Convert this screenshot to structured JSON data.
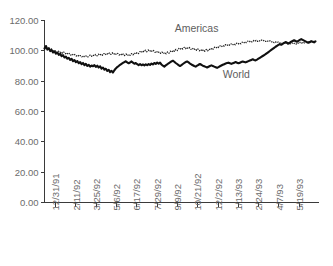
{
  "chart_data": {
    "type": "line",
    "title": "",
    "subtitle": "",
    "xlabel": "",
    "ylabel": "",
    "grid": false,
    "legend_position": "inline-annotation",
    "ylim": [
      0,
      120
    ],
    "ytick_labels": [
      "0.00",
      "20.00",
      "40.00",
      "60.00",
      "80.00",
      "100.00",
      "120.00"
    ],
    "ytick_values": [
      0,
      20,
      40,
      60,
      80,
      100,
      120
    ],
    "xtick_labels": [
      "12/31/91",
      "2/11/92",
      "3/25/92",
      "5/6/92",
      "6/17/92",
      "7/29/92",
      "9/9/92",
      "10/21/92",
      "12/2/92",
      "1/13/93",
      "2/24/93",
      "4/7/93",
      "5/19/93"
    ],
    "annotations": [
      {
        "text": "Americas",
        "x_frac": 0.555,
        "value": 112.5
      },
      {
        "text": "World",
        "x_frac": 0.7,
        "value": 82.0
      }
    ],
    "series": [
      {
        "name": "Americas",
        "style": "dotted",
        "color": "#1a1a1a",
        "values": [
          101.0,
          102.3,
          100.8,
          101.6,
          100.4,
          101.3,
          100.2,
          99.4,
          100.1,
          99.0,
          99.8,
          98.6,
          99.5,
          98.4,
          99.2,
          98.0,
          98.8,
          97.6,
          98.3,
          97.2,
          98.0,
          96.9,
          97.6,
          96.6,
          97.3,
          96.2,
          96.9,
          96.0,
          96.8,
          95.9,
          96.6,
          95.7,
          96.4,
          97.2,
          96.3,
          97.4,
          96.5,
          97.6,
          96.7,
          97.8,
          96.9,
          98.0,
          97.1,
          98.2,
          97.3,
          98.5,
          97.5,
          98.6,
          97.7,
          98.8,
          97.6,
          98.5,
          97.4,
          98.3,
          97.2,
          98.1,
          97.0,
          98.0,
          96.9,
          97.9,
          96.8,
          97.8,
          97.0,
          98.2,
          97.3,
          98.6,
          97.8,
          99.0,
          98.2,
          99.5,
          98.8,
          100.1,
          99.2,
          100.4,
          99.4,
          100.6,
          99.5,
          100.5,
          99.3,
          100.2,
          99.0,
          99.8,
          98.6,
          99.4,
          98.3,
          99.2,
          98.1,
          99.0,
          98.0,
          99.3,
          98.4,
          99.8,
          99.0,
          100.4,
          99.6,
          101.0,
          100.2,
          101.6,
          100.8,
          102.0,
          101.2,
          102.3,
          101.4,
          102.4,
          101.3,
          102.2,
          101.0,
          101.8,
          100.6,
          101.5,
          100.3,
          101.2,
          100.0,
          101.0,
          99.8,
          100.8,
          99.7,
          100.9,
          100.0,
          101.3,
          100.5,
          101.9,
          101.1,
          102.4,
          101.7,
          102.9,
          102.2,
          103.3,
          102.6,
          103.7,
          103.0,
          104.1,
          103.4,
          104.4,
          103.6,
          104.6,
          103.8,
          104.8,
          104.0,
          105.0,
          104.3,
          105.3,
          104.6,
          105.7,
          105.0,
          106.1,
          105.4,
          106.4,
          105.7,
          106.6,
          105.9,
          106.8,
          106.0,
          106.9,
          106.2,
          107.0,
          106.3,
          107.1,
          106.4,
          107.0,
          106.2,
          106.8,
          106.0,
          106.6,
          105.7,
          106.3,
          105.4,
          106.0,
          105.2,
          105.8,
          105.0,
          105.6,
          104.8,
          105.4,
          104.6,
          105.3,
          104.5,
          105.2,
          104.4,
          105.1,
          104.4,
          105.2,
          104.5,
          105.4,
          104.7,
          105.6,
          105.0,
          105.9,
          105.2,
          106.1,
          105.4,
          106.2,
          105.5,
          106.3,
          105.6,
          106.3,
          105.6
        ]
      },
      {
        "name": "World",
        "style": "solid",
        "color": "#101010",
        "values": [
          101.5,
          103.2,
          100.8,
          101.8,
          99.8,
          100.6,
          98.9,
          99.6,
          98.2,
          98.9,
          97.4,
          98.0,
          96.5,
          97.1,
          95.6,
          96.2,
          94.8,
          95.4,
          94.0,
          94.7,
          93.2,
          93.9,
          92.5,
          93.3,
          91.8,
          92.6,
          91.2,
          92.0,
          90.6,
          91.4,
          90.0,
          90.8,
          89.5,
          90.3,
          89.8,
          90.6,
          89.4,
          90.2,
          89.0,
          89.8,
          88.3,
          89.0,
          87.6,
          88.2,
          86.8,
          87.5,
          86.0,
          86.8,
          85.7,
          87.2,
          88.4,
          89.3,
          90.0,
          90.8,
          91.4,
          92.0,
          92.6,
          93.1,
          92.4,
          91.8,
          92.3,
          93.0,
          92.2,
          91.5,
          92.0,
          91.2,
          90.6,
          91.2,
          90.5,
          91.0,
          90.4,
          91.1,
          90.5,
          91.3,
          90.7,
          91.6,
          91.0,
          92.0,
          91.4,
          92.3,
          91.5,
          92.2,
          91.0,
          90.2,
          89.6,
          90.4,
          91.0,
          91.8,
          92.4,
          93.0,
          93.5,
          92.8,
          92.0,
          91.3,
          90.6,
          90.0,
          90.6,
          91.3,
          92.0,
          92.6,
          93.0,
          92.4,
          91.6,
          91.0,
          90.5,
          90.0,
          89.6,
          90.2,
          90.8,
          91.3,
          90.8,
          90.2,
          89.8,
          89.4,
          89.0,
          89.5,
          90.0,
          90.4,
          90.0,
          89.6,
          89.2,
          88.8,
          89.3,
          89.8,
          90.3,
          90.8,
          91.2,
          91.6,
          91.9,
          92.2,
          91.8,
          91.4,
          91.8,
          92.2,
          92.6,
          92.2,
          91.8,
          92.2,
          92.6,
          93.0,
          92.7,
          92.4,
          92.8,
          93.2,
          93.6,
          94.0,
          94.4,
          94.0,
          93.7,
          94.2,
          94.8,
          95.4,
          96.0,
          96.6,
          97.2,
          97.8,
          98.5,
          99.2,
          99.9,
          100.6,
          101.3,
          102.0,
          102.7,
          103.3,
          103.9,
          104.4,
          104.0,
          104.6,
          105.2,
          105.8,
          105.3,
          104.8,
          105.4,
          106.0,
          106.5,
          107.0,
          106.5,
          106.0,
          106.6,
          107.2,
          107.7,
          107.2,
          106.7,
          106.2,
          105.7,
          105.3,
          105.8,
          106.4,
          106.0,
          105.6,
          106.2
        ]
      }
    ]
  }
}
